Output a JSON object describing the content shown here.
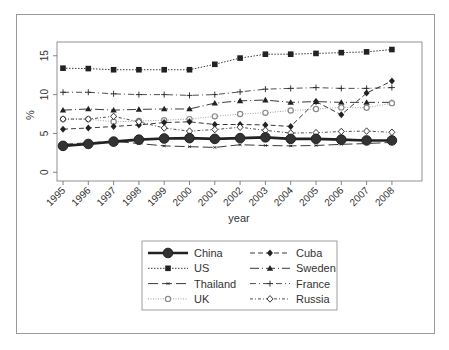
{
  "chart_data": {
    "type": "line",
    "title": "",
    "xlabel": "year",
    "ylabel": "%",
    "ylim": [
      0,
      16.5
    ],
    "yticks": [
      0,
      5,
      10,
      15
    ],
    "grid": false,
    "legend_position": "bottom",
    "x": [
      "1995",
      "1996",
      "1997",
      "1998",
      "1999",
      "2000",
      "2001",
      "2002",
      "2003",
      "2004",
      "2005",
      "2006",
      "2007",
      "2008"
    ],
    "series": [
      {
        "name": "China",
        "marker": "filled-circle-large",
        "line": "solid-thick",
        "values": [
          3.4,
          3.65,
          3.95,
          4.2,
          4.35,
          4.4,
          4.3,
          4.4,
          4.5,
          4.3,
          4.3,
          4.2,
          4.1,
          4.1
        ]
      },
      {
        "name": "Cuba",
        "marker": "filled-diamond",
        "line": "dashed",
        "values": [
          5.55,
          5.7,
          5.9,
          6.1,
          6.4,
          6.5,
          6.15,
          6.15,
          6.1,
          5.9,
          9.1,
          7.4,
          10.2,
          11.75
        ]
      },
      {
        "name": "US",
        "marker": "filled-square",
        "line": "dotted",
        "values": [
          13.4,
          13.35,
          13.2,
          13.2,
          13.2,
          13.2,
          13.9,
          14.7,
          15.2,
          15.2,
          15.3,
          15.4,
          15.5,
          15.8
        ]
      },
      {
        "name": "Sweden",
        "marker": "filled-triangle",
        "line": "longdash-dot",
        "values": [
          8.0,
          8.15,
          8.0,
          8.1,
          8.15,
          8.15,
          8.9,
          9.2,
          9.3,
          9.0,
          9.1,
          9.0,
          9.0,
          9.0
        ]
      },
      {
        "name": "Thailand",
        "marker": "small-x",
        "line": "longdash",
        "values": [
          3.6,
          3.8,
          4.0,
          3.7,
          3.4,
          3.3,
          3.2,
          3.55,
          3.45,
          3.4,
          3.45,
          3.6,
          3.7,
          3.85
        ]
      },
      {
        "name": "France",
        "marker": "plus",
        "line": "dash-dot",
        "values": [
          10.3,
          10.3,
          10.1,
          10.0,
          10.0,
          9.9,
          10.0,
          10.35,
          10.7,
          10.8,
          10.9,
          10.8,
          10.8,
          10.9
        ]
      },
      {
        "name": "UK",
        "marker": "open-circle-grey",
        "line": "fine-dotted",
        "values": [
          6.85,
          6.85,
          6.5,
          6.6,
          6.7,
          6.85,
          7.2,
          7.5,
          7.65,
          7.95,
          8.15,
          8.35,
          8.3,
          8.9
        ]
      },
      {
        "name": "Russia",
        "marker": "open-diamond",
        "line": "dot-dash",
        "values": [
          6.85,
          6.85,
          7.2,
          6.5,
          5.7,
          5.3,
          5.5,
          5.8,
          5.4,
          5.05,
          5.1,
          5.25,
          5.3,
          5.15
        ]
      }
    ]
  },
  "axes": {
    "ylabel": "%",
    "xlabel": "year",
    "yticks": [
      "0",
      "5",
      "10",
      "15"
    ],
    "xticks": [
      "1995",
      "1996",
      "1997",
      "1998",
      "1999",
      "2000",
      "2001",
      "2002",
      "2003",
      "2004",
      "2005",
      "2006",
      "2007",
      "2008"
    ]
  },
  "legend": {
    "items": [
      "China",
      "Cuba",
      "US",
      "Sweden",
      "Thailand",
      "France",
      "UK",
      "Russia"
    ]
  },
  "colors": {
    "ink": "#222222",
    "grey_marker": "#8a8a8a",
    "frame": "#9a9a9a"
  }
}
